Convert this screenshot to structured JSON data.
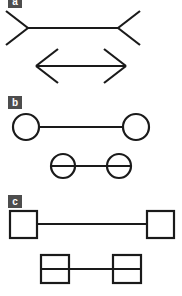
{
  "figure": {
    "background_color": "#ffffff",
    "stroke_color": "#1a1a1a",
    "badge_background_color": "#4d4d4d",
    "badge_text_color": "#ffffff",
    "width": 182,
    "height": 296
  },
  "panels": [
    {
      "id": "a",
      "label": "a",
      "terminator": "arrowhead-fins",
      "figures": [
        {
          "name": "outward-fins-figure",
          "description": "Horizontal shaft with outward pointing fins at both ends",
          "shaft": {
            "x1": 28,
            "y1": 28,
            "x2": 118,
            "y2": 28,
            "length": 90
          },
          "left_fins": [
            {
              "x1": 28,
              "y1": 28,
              "x2": 6,
              "y2": 11
            },
            {
              "x1": 28,
              "y1": 28,
              "x2": 6,
              "y2": 45
            }
          ],
          "right_fins": [
            {
              "x1": 118,
              "y1": 28,
              "x2": 140,
              "y2": 11
            },
            {
              "x1": 118,
              "y1": 28,
              "x2": 140,
              "y2": 45
            }
          ]
        },
        {
          "name": "inward-fins-figure",
          "description": "Horizontal shaft with inward pointing arrowheads at both ends",
          "shaft": {
            "x1": 36,
            "y1": 66,
            "x2": 126,
            "y2": 66,
            "length": 90
          },
          "left_fins": [
            {
              "x1": 36,
              "y1": 66,
              "x2": 58,
              "y2": 49
            },
            {
              "x1": 36,
              "y1": 66,
              "x2": 58,
              "y2": 83
            }
          ],
          "right_fins": [
            {
              "x1": 126,
              "y1": 66,
              "x2": 104,
              "y2": 49
            },
            {
              "x1": 126,
              "y1": 66,
              "x2": 104,
              "y2": 83
            }
          ]
        }
      ]
    },
    {
      "id": "b",
      "label": "b",
      "terminator": "circle",
      "figures": [
        {
          "name": "circles-outside-figure",
          "description": "Shaft ending at two circles placed outside the span",
          "shaft": {
            "x1": 39,
            "y1": 31,
            "x2": 123,
            "y2": 31,
            "length": 84
          },
          "nodes": [
            {
              "shape": "circle",
              "cx": 26,
              "cy": 31,
              "r": 13
            },
            {
              "shape": "circle",
              "cx": 136,
              "cy": 31,
              "r": 13
            }
          ]
        },
        {
          "name": "circles-inside-figure",
          "description": "Shaft passing through two circles placed inside the span",
          "shaft": {
            "x1": 51,
            "y1": 70,
            "x2": 131,
            "y2": 70,
            "length": 80
          },
          "nodes": [
            {
              "shape": "circle",
              "cx": 63,
              "cy": 70,
              "r": 12
            },
            {
              "shape": "circle",
              "cx": 119,
              "cy": 70,
              "r": 12
            }
          ]
        }
      ]
    },
    {
      "id": "c",
      "label": "c",
      "terminator": "square",
      "figures": [
        {
          "name": "squares-outside-figure",
          "description": "Shaft ending at two squares placed outside the span",
          "shaft": {
            "x1": 37,
            "y1": 32,
            "x2": 147,
            "y2": 32,
            "length": 110
          },
          "nodes": [
            {
              "shape": "square",
              "x": 10,
              "y": 19,
              "width": 27,
              "height": 27
            },
            {
              "shape": "square",
              "x": 147,
              "y": 19,
              "width": 27,
              "height": 27
            }
          ]
        },
        {
          "name": "squares-inside-figure",
          "description": "Shaft passing through two squares placed inside the span",
          "shaft": {
            "x1": 41,
            "y1": 77,
            "x2": 141,
            "y2": 77,
            "length": 100
          },
          "nodes": [
            {
              "shape": "square",
              "x": 41,
              "y": 63,
              "width": 28,
              "height": 28
            },
            {
              "shape": "square",
              "x": 113,
              "y": 63,
              "width": 28,
              "height": 28
            }
          ]
        }
      ]
    }
  ]
}
